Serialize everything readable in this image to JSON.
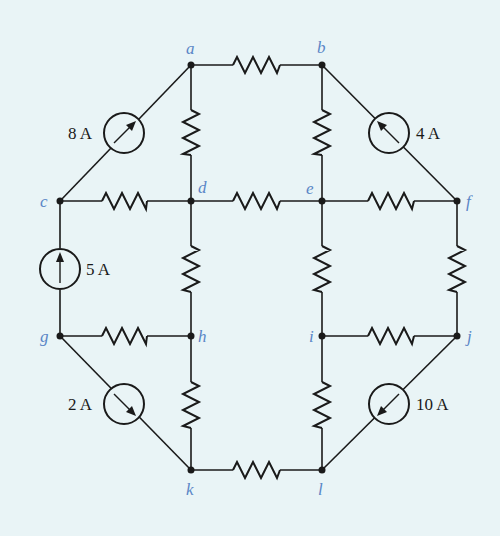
{
  "diagram": {
    "type": "circuit",
    "background": "#e9f4f6",
    "label_color": "#5a86c6",
    "nodes": [
      {
        "id": "a",
        "label": "a",
        "x": 191,
        "y": 65
      },
      {
        "id": "b",
        "label": "b",
        "x": 322,
        "y": 65
      },
      {
        "id": "c",
        "label": "c",
        "x": 60,
        "y": 201
      },
      {
        "id": "d",
        "label": "d",
        "x": 191,
        "y": 201
      },
      {
        "id": "e",
        "label": "e",
        "x": 322,
        "y": 201
      },
      {
        "id": "f",
        "label": "f",
        "x": 457,
        "y": 201
      },
      {
        "id": "g",
        "label": "g",
        "x": 60,
        "y": 336
      },
      {
        "id": "h",
        "label": "h",
        "x": 191,
        "y": 336
      },
      {
        "id": "i",
        "label": "i",
        "x": 322,
        "y": 336
      },
      {
        "id": "j",
        "label": "j",
        "x": 457,
        "y": 336
      },
      {
        "id": "k",
        "label": "k",
        "x": 191,
        "y": 470
      },
      {
        "id": "l",
        "label": "l",
        "x": 322,
        "y": 470
      }
    ],
    "resistors": [
      {
        "from": "a",
        "to": "b"
      },
      {
        "from": "a",
        "to": "d"
      },
      {
        "from": "b",
        "to": "e"
      },
      {
        "from": "c",
        "to": "d"
      },
      {
        "from": "d",
        "to": "e"
      },
      {
        "from": "e",
        "to": "f"
      },
      {
        "from": "d",
        "to": "h"
      },
      {
        "from": "e",
        "to": "i"
      },
      {
        "from": "f",
        "to": "j"
      },
      {
        "from": "g",
        "to": "h"
      },
      {
        "from": "i",
        "to": "j"
      },
      {
        "from": "h",
        "to": "k"
      },
      {
        "from": "i",
        "to": "l"
      },
      {
        "from": "k",
        "to": "l"
      }
    ],
    "current_sources": [
      {
        "from": "c",
        "to": "a",
        "label": "8 A",
        "direction": "toward a"
      },
      {
        "from": "f",
        "to": "b",
        "label": "4 A",
        "direction": "toward b"
      },
      {
        "from": "g",
        "to": "c",
        "label": "5 A",
        "direction": "toward c"
      },
      {
        "from": "g",
        "to": "k",
        "label": "2 A",
        "direction": "toward k"
      },
      {
        "from": "j",
        "to": "l",
        "label": "10 A",
        "direction": "toward l"
      }
    ]
  }
}
